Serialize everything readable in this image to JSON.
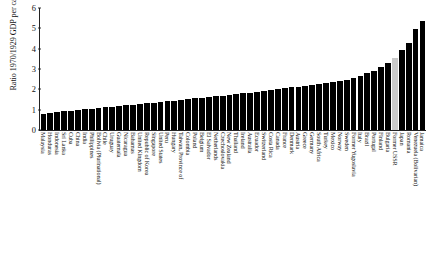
{
  "chart_data": {
    "type": "bar",
    "title": "",
    "xlabel": "",
    "ylabel": "Ratio 1970/1929 GDP per capita",
    "ylim": [
      0,
      6
    ],
    "yticks": [
      0,
      1,
      2,
      3,
      4,
      5,
      6
    ],
    "grid": false,
    "legend": null,
    "bar_color": "#000000",
    "highlight_color": "#c9c9c9",
    "highlight_categories": [
      "Former USSR"
    ],
    "categories": [
      "Malaysia",
      "Honduras",
      "Indonesia",
      "Sri Lanka",
      "Cuba",
      "China",
      "India",
      "Philippines",
      "Bolivia (Plurinational)",
      "Chile",
      "Uruguay",
      "Guatemala",
      "Nicaragua",
      "Bahamas",
      "United Kingdom",
      "Republic of Korea",
      "Singapore",
      "United States",
      "Peru",
      "Hungary",
      "Taiwan, Province of",
      "Colombia",
      "Poland",
      "Belgium",
      "El Salvador",
      "Netherlands",
      "Czechoslovakia",
      "New Zealand",
      "Thailand",
      "Ireland",
      "Australia",
      "Ecuador",
      "Switzerland",
      "Costa Rica",
      "Canada",
      "France",
      "Denmark",
      "Austria",
      "Greece",
      "Germany",
      "South Africa",
      "Turkey",
      "Mexico",
      "Norway",
      "Sweden",
      "Former Yugoslavia",
      "Italy",
      "Brazil",
      "Portugal",
      "Finland",
      "Bulgaria",
      "Former USSR",
      "Japan",
      "Romania",
      "Venezuela (Bolivarian)",
      "Jamaica"
    ],
    "values": [
      0.78,
      0.84,
      0.88,
      0.92,
      0.95,
      0.98,
      1.02,
      1.05,
      1.08,
      1.12,
      1.15,
      1.18,
      1.22,
      1.25,
      1.28,
      1.32,
      1.35,
      1.38,
      1.42,
      1.45,
      1.48,
      1.52,
      1.55,
      1.58,
      1.62,
      1.65,
      1.68,
      1.72,
      1.75,
      1.8,
      1.84,
      1.88,
      1.92,
      1.96,
      2.0,
      2.05,
      2.1,
      2.14,
      2.18,
      2.22,
      2.26,
      2.3,
      2.36,
      2.42,
      2.48,
      2.56,
      2.66,
      2.78,
      2.92,
      3.08,
      3.28,
      3.52,
      3.95,
      4.3,
      4.95,
      5.35
    ]
  }
}
